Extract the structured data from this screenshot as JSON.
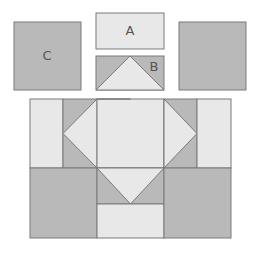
{
  "diagram": {
    "colors": {
      "light": "#e8e8e8",
      "dark": "#b9b9b9",
      "stroke": "#7a7a7a"
    },
    "pieces": {
      "C": {
        "label": "C",
        "description": "Square, dark fabric"
      },
      "A": {
        "label": "A",
        "description": "Rectangle, light fabric"
      },
      "B": {
        "label": "B",
        "description": "Flying-geese unit: light triangle on dark rectangle"
      },
      "unlabeled_square": {
        "label": "",
        "description": "Square, dark fabric"
      }
    },
    "assembled_block": {
      "description": "Assembled block: top row with A rectangles and flying-geese units around a center square; bottom row with dark C squares and a flying-geese + A unit in the middle"
    }
  }
}
